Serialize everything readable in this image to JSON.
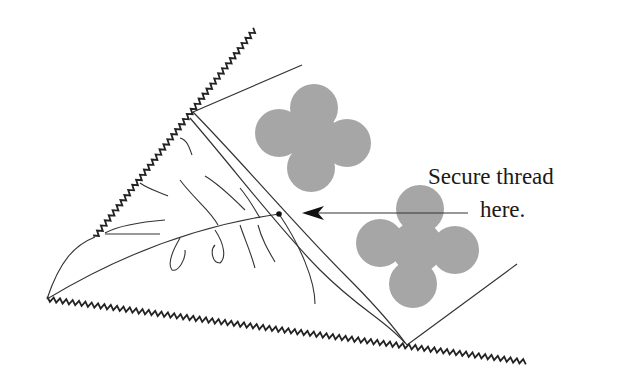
{
  "diagram": {
    "type": "sewing-illustration",
    "annotation": {
      "line1": "Secure thread",
      "line2": "here.",
      "arrow_target": "thread-anchor-dot"
    },
    "colors": {
      "stroke": "#333333",
      "zigzag": "#222222",
      "flower_fill": "#a6a6a6",
      "text": "#1a1a1a",
      "background": "#ffffff"
    },
    "elements": [
      {
        "name": "pinked-edge-upper",
        "kind": "zigzag-edge"
      },
      {
        "name": "pinked-edge-lower",
        "kind": "zigzag-edge"
      },
      {
        "name": "leaf-shape",
        "kind": "curved-outline-with-veins"
      },
      {
        "name": "fabric-fold",
        "kind": "folded-panel"
      },
      {
        "name": "flower-appliqué-1",
        "kind": "four-petal-shape"
      },
      {
        "name": "flower-appliqué-2",
        "kind": "four-petal-shape"
      },
      {
        "name": "thread-anchor-dot",
        "kind": "dot"
      },
      {
        "name": "pointer-arrow",
        "kind": "arrow"
      }
    ]
  }
}
